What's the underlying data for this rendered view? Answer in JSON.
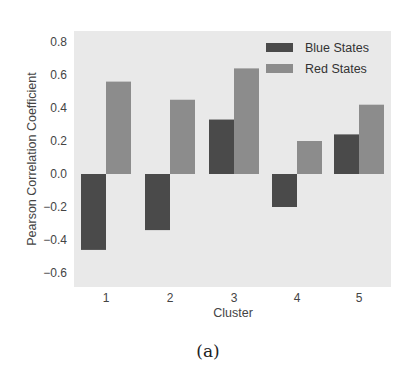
{
  "chart_data": {
    "type": "bar",
    "title": "",
    "xlabel": "Cluster",
    "ylabel": "Pearson Correlation Coefficient",
    "categories": [
      "1",
      "2",
      "3",
      "4",
      "5"
    ],
    "series": [
      {
        "name": "Blue States",
        "color": "#4a4a4a",
        "values": [
          -0.46,
          -0.34,
          0.33,
          -0.2,
          0.24
        ]
      },
      {
        "name": "Red States",
        "color": "#8c8c8c",
        "values": [
          0.56,
          0.45,
          0.64,
          0.2,
          0.42
        ]
      }
    ],
    "ylim": [
      -0.69,
      0.87
    ],
    "yticks": [
      -0.6,
      -0.4,
      -0.2,
      0.0,
      0.2,
      0.4,
      0.6,
      0.8
    ],
    "ytick_labels": [
      "−0.6",
      "−0.4",
      "−0.2",
      "0.0",
      "0.2",
      "0.4",
      "0.6",
      "0.8"
    ],
    "grid": false,
    "legend_position": "upper right",
    "plot_background": "#e9e9e9"
  },
  "caption": "(a)"
}
